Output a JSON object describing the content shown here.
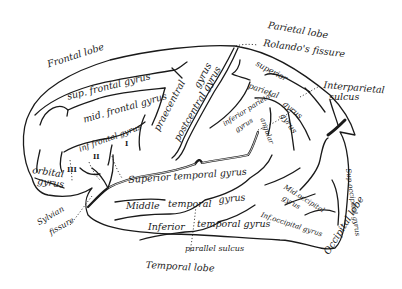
{
  "colors": {
    "ink": "#1a1a1a",
    "background": "#ffffff"
  },
  "lobes": {
    "frontal": "Frontal lobe",
    "parietal": "Parietal lobe",
    "temporal": "Temporal lobe",
    "occipital": "Occipital lobe"
  },
  "fissures": {
    "rolando": "Rolando's fissure",
    "sylvian_1": "Sylvian",
    "sylvian_2": "fissure",
    "interparietal_1": "Interparietal",
    "interparietal_2": "sulcus",
    "parallel": "parallel sulcus"
  },
  "gyri": {
    "sup_frontal": "sup. frontal gyrus",
    "mid_frontal": "mid. frontal gyrus",
    "inf_frontal": "inf frontal gyrus",
    "orbital_1": "orbital",
    "orbital_2": "gyrus",
    "precentral": "praecentral",
    "precentral_gyrus": "gyrus",
    "postcentral": "postcentral gyrus",
    "sup_parietal_1": "superior",
    "sup_parietal_2": "parietal",
    "sup_parietal_3": "gyrus",
    "inf_parietal_1": "inferior parietal",
    "inf_parietal_2": "gyrus",
    "supramarginal": "lobule",
    "angular_1": "angular",
    "angular_2": "gyrus",
    "sup_temporal": "Superior temporal gyrus",
    "mid_temporal_1": "Middle",
    "mid_temporal_2": "temporal",
    "mid_temporal_3": "gyrus",
    "inf_temporal_1": "Inferior",
    "inf_temporal_2": "temporal gyrus",
    "mid_occipital_1": "Mid.occipital",
    "mid_occipital_2": "gyrus",
    "inf_occipital": "Inf.occipital gyrus",
    "sup_occipital": "Sup.occipital gyrus"
  },
  "roman_markers": {
    "i": "I",
    "ii": "II",
    "iii": "III"
  }
}
